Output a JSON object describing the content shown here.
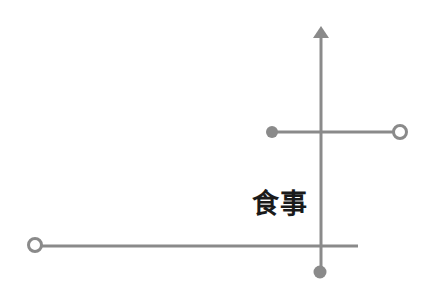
{
  "diagram": {
    "label": "食事",
    "colors": {
      "line": "#8a8a8a",
      "text": "#1a1a1a",
      "background": "#ffffff"
    },
    "vertical_axis": {
      "x": 321,
      "y_top": 27,
      "y_bottom": 272,
      "arrow": "up",
      "end_marker": "filled-dot"
    },
    "upper_branch": {
      "y": 132,
      "x_start": 272,
      "x_end": 400,
      "start_marker": "filled-dot",
      "end_marker": "open-circle"
    },
    "lower_branch": {
      "y": 246,
      "x_start": 35,
      "x_end": 358,
      "start_marker": "open-circle",
      "end_marker": "none"
    }
  }
}
